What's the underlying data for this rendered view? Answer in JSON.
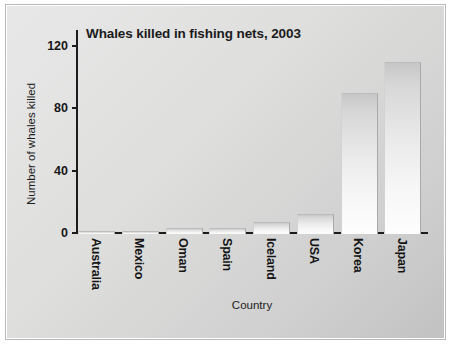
{
  "chart_data": {
    "type": "bar",
    "title": "Whales killed in fishing nets, 2003",
    "xlabel": "Country",
    "ylabel": "Number of whales killed",
    "categories": [
      "Australia",
      "Mexico",
      "Oman",
      "Spain",
      "Iceland",
      "USA",
      "Korea",
      "Japan"
    ],
    "values": [
      2,
      2,
      4,
      4,
      8,
      13,
      90,
      110
    ],
    "ylim": [
      0,
      130
    ],
    "yticks": [
      0,
      40,
      80,
      120
    ],
    "ytick_labels": [
      "0",
      "40",
      "80",
      "120"
    ],
    "grid": false,
    "legend": false,
    "colors": {
      "bar_fill_top": "#c7c7c7",
      "bar_fill_bottom": "#fdfdfd",
      "axis": "#1c1c1c",
      "text": "#171717",
      "canvas_background": "#dededd",
      "page_background": "#ffffff"
    }
  }
}
